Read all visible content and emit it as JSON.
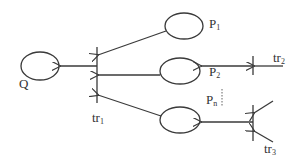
{
  "diagram": {
    "type": "petri-net-like",
    "colors": {
      "stroke": "#3a3a3a",
      "text": "#333333",
      "background": "#ffffff"
    },
    "places": [
      {
        "id": "Q",
        "label": "Q",
        "sub": ""
      },
      {
        "id": "P1",
        "label": "P",
        "sub": "1"
      },
      {
        "id": "P2",
        "label": "P",
        "sub": "2"
      },
      {
        "id": "Pn",
        "label": "P",
        "sub": "n"
      }
    ],
    "transitions": [
      {
        "id": "tr1",
        "label": "tr",
        "sub": "1"
      },
      {
        "id": "tr2",
        "label": "tr",
        "sub": "2"
      },
      {
        "id": "tr3",
        "label": "tr",
        "sub": "3"
      }
    ],
    "edges": [
      {
        "from": "P1",
        "to": "tr1"
      },
      {
        "from": "P2",
        "to": "tr1"
      },
      {
        "from": "Pn",
        "to": "tr1"
      },
      {
        "from": "tr1",
        "to": "Q"
      },
      {
        "from": "tr2",
        "to": "P2"
      },
      {
        "from": "tr3",
        "to": "Pn"
      }
    ],
    "ellipsis": "⋮"
  }
}
